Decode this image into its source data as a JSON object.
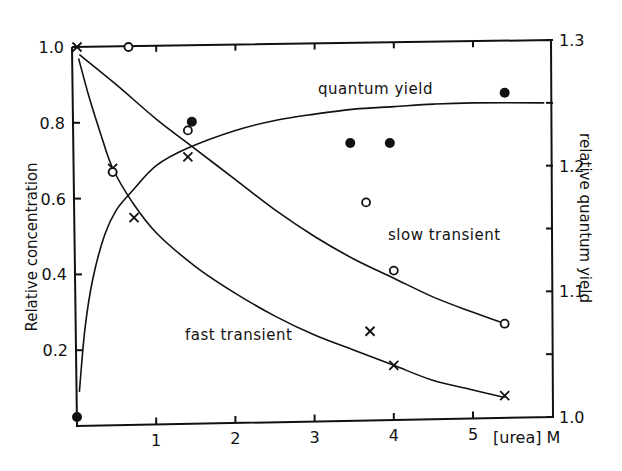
{
  "chart_data": {
    "type": "scatter",
    "title": "",
    "xlabel": "[urea] M",
    "ylabel": "Relative concentration",
    "ylabel_right": "relative quantum yield",
    "xlim": [
      0,
      5.9
    ],
    "ylim": [
      0,
      1.0
    ],
    "ylim_right": [
      1.0,
      1.3
    ],
    "x_ticks": [
      1,
      2,
      3,
      4,
      5
    ],
    "x_tick_labels": [
      "1",
      "2",
      "3",
      "4",
      "5"
    ],
    "y_ticks": [
      0.2,
      0.4,
      0.6,
      0.8,
      1.0
    ],
    "y_tick_labels": [
      "0.2",
      "0.4",
      "0.6",
      "0.8",
      "1.0"
    ],
    "y_right_ticks": [
      1.0,
      1.05,
      1.1,
      1.15,
      1.2,
      1.25,
      1.3
    ],
    "y_right_tick_labels": [
      "1.0",
      "",
      "1.1",
      "",
      "1.2",
      "",
      "1.3"
    ],
    "grid": false,
    "legend": null,
    "annotations": [
      {
        "text": "quantum yield",
        "x": 3.05,
        "y_right": 1.28
      },
      {
        "text": "slow transient",
        "x": 3.95,
        "y": 0.48
      },
      {
        "text": "fast transient",
        "x": 1.35,
        "y": 0.2
      }
    ],
    "series": [
      {
        "name": "fast transient",
        "marker": "x",
        "axis": "left",
        "points": [
          {
            "x": 0.0,
            "y": 1.0
          },
          {
            "x": 0.45,
            "y": 0.68
          },
          {
            "x": 0.72,
            "y": 0.55
          },
          {
            "x": 1.4,
            "y": 0.71
          },
          {
            "x": 3.7,
            "y": 0.25
          },
          {
            "x": 4.0,
            "y": 0.16
          },
          {
            "x": 5.4,
            "y": 0.08
          }
        ],
        "fit_curve": [
          [
            0.02,
            0.97
          ],
          [
            0.15,
            0.87
          ],
          [
            0.3,
            0.77
          ],
          [
            0.45,
            0.68
          ],
          [
            0.7,
            0.59
          ],
          [
            1.0,
            0.51
          ],
          [
            1.5,
            0.42
          ],
          [
            2.0,
            0.35
          ],
          [
            2.5,
            0.29
          ],
          [
            3.0,
            0.24
          ],
          [
            3.5,
            0.2
          ],
          [
            4.0,
            0.16
          ],
          [
            4.5,
            0.12
          ],
          [
            5.0,
            0.095
          ],
          [
            5.4,
            0.075
          ]
        ]
      },
      {
        "name": "slow transient",
        "marker": "open-circle",
        "axis": "left",
        "points": [
          {
            "x": 0.65,
            "y": 1.0
          },
          {
            "x": 0.45,
            "y": 0.67
          },
          {
            "x": 1.4,
            "y": 0.78
          },
          {
            "x": 3.65,
            "y": 0.59
          },
          {
            "x": 4.0,
            "y": 0.41
          },
          {
            "x": 5.4,
            "y": 0.27
          }
        ],
        "fit_curve": [
          [
            0.03,
            0.98
          ],
          [
            0.5,
            0.9
          ],
          [
            1.0,
            0.81
          ],
          [
            1.5,
            0.73
          ],
          [
            2.0,
            0.65
          ],
          [
            2.5,
            0.57
          ],
          [
            3.0,
            0.5
          ],
          [
            3.5,
            0.44
          ],
          [
            4.0,
            0.39
          ],
          [
            4.5,
            0.34
          ],
          [
            5.0,
            0.3
          ],
          [
            5.4,
            0.27
          ]
        ]
      },
      {
        "name": "quantum yield",
        "marker": "filled-circle",
        "axis": "right",
        "points": [
          {
            "x": 0.0,
            "y": 1.0
          },
          {
            "x": 1.45,
            "y": 1.235
          },
          {
            "x": 3.45,
            "y": 1.218
          },
          {
            "x": 3.95,
            "y": 1.218
          },
          {
            "x": 5.4,
            "y": 1.258
          }
        ],
        "fit_curve": [
          [
            0.03,
            1.02
          ],
          [
            0.1,
            1.07
          ],
          [
            0.2,
            1.11
          ],
          [
            0.35,
            1.145
          ],
          [
            0.5,
            1.165
          ],
          [
            0.7,
            1.18
          ],
          [
            1.0,
            1.2
          ],
          [
            1.4,
            1.214
          ],
          [
            2.0,
            1.228
          ],
          [
            2.5,
            1.236
          ],
          [
            3.0,
            1.241
          ],
          [
            3.5,
            1.245
          ],
          [
            4.0,
            1.247
          ],
          [
            4.5,
            1.249
          ],
          [
            5.0,
            1.25
          ],
          [
            5.9,
            1.25
          ]
        ]
      }
    ]
  },
  "labels": {
    "y_left_title": "Relative concentration",
    "y_right_title": "relative quantum yield",
    "x_unit": "[urea] M",
    "annot_qy": "quantum yield",
    "annot_slow": "slow transient",
    "annot_fast": "fast transient"
  }
}
